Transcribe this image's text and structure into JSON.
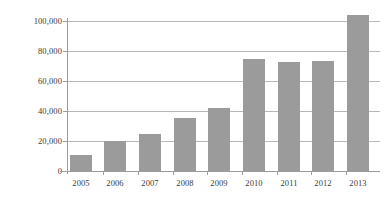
{
  "chart_data": {
    "type": "bar",
    "title": "",
    "subtitle": "",
    "xlabel": "",
    "ylabel": "",
    "categories": [
      "2005",
      "2006",
      "2007",
      "2008",
      "2009",
      "2010",
      "2011",
      "2012",
      "2013"
    ],
    "values": [
      11000,
      20000,
      25000,
      35500,
      42000,
      75000,
      73000,
      73500,
      104000
    ],
    "series": [
      {
        "name": "",
        "values": [
          11000,
          20000,
          25000,
          35500,
          42000,
          75000,
          73000,
          73500,
          104000
        ]
      }
    ],
    "ylim": [
      0,
      100000
    ],
    "ytick_values": [
      0,
      20000,
      40000,
      60000,
      80000,
      100000
    ],
    "ytick_labels": [
      "0",
      "20,000",
      "40,000",
      "60,000",
      "80,000",
      "100,000"
    ],
    "grid": true,
    "grid_axis": "y",
    "legend": false,
    "legend_position": "none",
    "bar_color": "#9b9b9b",
    "gridline_color": "#b7b7b7",
    "axis_color": "#9c9c9c",
    "background_color": "#ffffff",
    "annotations": []
  }
}
